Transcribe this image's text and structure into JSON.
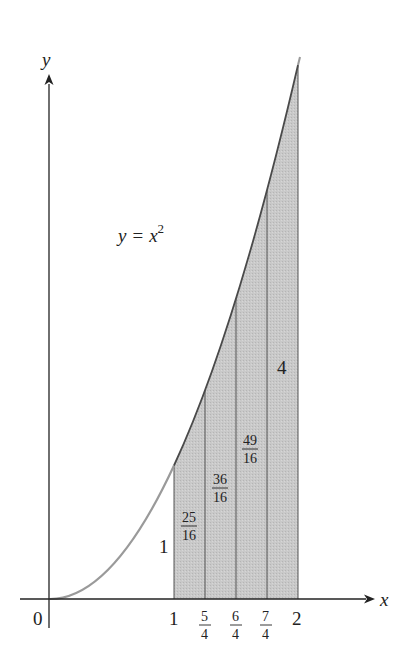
{
  "figure": {
    "curve_label": {
      "lhs": "y",
      "eq": "=",
      "base": "x",
      "exp": "2"
    },
    "axes": {
      "x_label": "x",
      "y_label": "y",
      "origin_label": "0",
      "x_ticks": [
        {
          "value": 1,
          "label": "1"
        },
        {
          "value": 1.25,
          "num": "5",
          "den": "4"
        },
        {
          "value": 1.5,
          "num": "6",
          "den": "4"
        },
        {
          "value": 1.75,
          "num": "7",
          "den": "4"
        },
        {
          "value": 2,
          "label": "2"
        }
      ]
    },
    "strip_labels": [
      {
        "text": "1"
      },
      {
        "num": "25",
        "den": "16"
      },
      {
        "num": "36",
        "den": "16"
      },
      {
        "num": "49",
        "den": "16"
      },
      {
        "text": "4"
      }
    ],
    "colors": {
      "curve": "#555555",
      "curve_lower": "#999999",
      "fill": "#c8c8c8",
      "axis": "#222222"
    }
  },
  "chart_data": {
    "type": "area",
    "title": "",
    "function": "y = x^2",
    "xlabel": "x",
    "ylabel": "y",
    "x": [
      0,
      0.25,
      0.5,
      0.75,
      1,
      1.25,
      1.5,
      1.75,
      2
    ],
    "values": [
      0,
      0.0625,
      0.25,
      0.5625,
      1,
      1.5625,
      2.25,
      3.0625,
      4
    ],
    "shaded_region": {
      "x_from": 1,
      "x_to": 2,
      "subintervals": 4
    },
    "subinterval_edges": [
      1,
      1.25,
      1.5,
      1.75,
      2
    ],
    "edge_heights": [
      "1",
      "25/16",
      "36/16",
      "49/16",
      "4"
    ],
    "x_tick_labels": [
      "0",
      "1",
      "5/4",
      "6/4",
      "7/4",
      "2"
    ],
    "grid": false
  }
}
